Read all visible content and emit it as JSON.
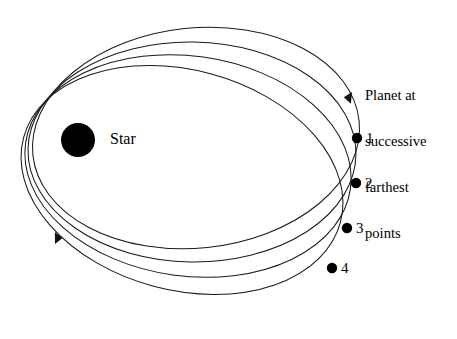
{
  "figure": {
    "type": "orbital-precession-diagram",
    "width": 457,
    "height": 339,
    "background_color": "#ffffff",
    "line_color": "#1a1a1a",
    "marker_color": "#000000"
  },
  "star": {
    "label": "Star",
    "center_x": 78,
    "center_y": 140,
    "radius": 17,
    "color": "#000000"
  },
  "caption": {
    "lines": [
      "Planet at",
      "successive",
      "farthest",
      "points"
    ],
    "x": 365,
    "y": 57
  },
  "planet_points": [
    {
      "label": "1",
      "x": 357,
      "y": 138,
      "radius": 5.2,
      "label_x": 366,
      "label_y": 130
    },
    {
      "label": "2",
      "x": 356,
      "y": 183,
      "radius": 5.2,
      "label_x": 365,
      "label_y": 175
    },
    {
      "label": "3",
      "x": 347,
      "y": 228,
      "radius": 5.2,
      "label_x": 356,
      "label_y": 220
    },
    {
      "label": "4",
      "x": 332,
      "y": 268,
      "radius": 5.2,
      "label_x": 341,
      "label_y": 260
    }
  ],
  "orbits": [
    {
      "name": "orbit-1",
      "cx": 196,
      "cy": 138,
      "rx": 164,
      "ry": 110,
      "rotation_deg": -6
    },
    {
      "name": "orbit-2",
      "cx": 192,
      "cy": 152,
      "rx": 164,
      "ry": 110,
      "rotation_deg": 1
    },
    {
      "name": "orbit-3",
      "cx": 188,
      "cy": 166,
      "rx": 164,
      "ry": 110,
      "rotation_deg": 8
    },
    {
      "name": "orbit-4",
      "cx": 182,
      "cy": 180,
      "rx": 164,
      "ry": 110,
      "rotation_deg": 15
    }
  ],
  "direction_arrows": [
    {
      "name": "arrow-top-right",
      "x": 352,
      "y": 92,
      "angle_deg": -62,
      "meaning": "orbital-motion-direction"
    },
    {
      "name": "arrow-bottom-left",
      "x": 55,
      "y": 244,
      "angle_deg": 112,
      "meaning": "orbital-motion-direction"
    }
  ]
}
